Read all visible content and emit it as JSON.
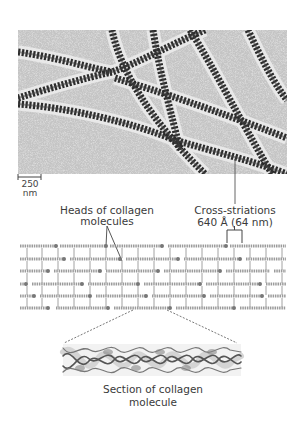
{
  "figure": {
    "micrograph": {
      "description": "Electron micrograph of collagen fibrils with cross-striations",
      "scale_bar": {
        "value": "250",
        "unit": "nm"
      }
    },
    "labels": {
      "cross_striations_line1": "Cross-striations",
      "cross_striations_line2": "640 Å (64 nm)",
      "heads_line1": "Heads of collagen",
      "heads_line2": "molecules",
      "section_line1": "Section of collagen",
      "section_line2": "molecule"
    },
    "schematic": {
      "rows": 6,
      "description": "Staggered array of collagen molecules"
    },
    "colors": {
      "background": "#ffffff",
      "micrograph_bg": "#b8b8b8",
      "fibril": "#2a2a2a",
      "text": "#3a3a3a",
      "leader": "#555555"
    }
  }
}
